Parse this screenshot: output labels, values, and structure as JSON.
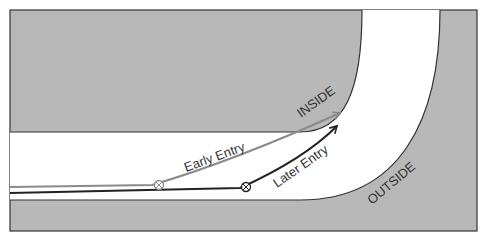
{
  "diagram": {
    "labels": {
      "inside": "INSIDE",
      "outside": "OUTSIDE",
      "early_entry": "Early Entry",
      "later_entry": "Later Entry"
    },
    "colors": {
      "ground": "#b8b8b8",
      "road": "#ffffff",
      "edge": "#333333",
      "early_line": "#8a8a8a",
      "later_line": "#222222"
    }
  }
}
